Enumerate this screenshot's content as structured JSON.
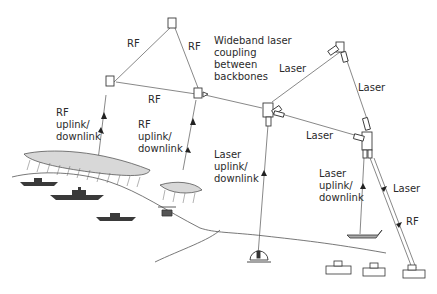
{
  "diagram": {
    "nodes": {
      "rf_top": "RF relay (top)",
      "rf_left": "RF relay (left)",
      "rf_mid": "RF relay (center, backbone coupling)",
      "laser_center": "Laser node (center)",
      "laser_top": "Laser node (top right)",
      "laser_right": "Laser node (right)"
    },
    "labels": {
      "rf_top_left": "RF",
      "rf_top_right": "RF",
      "rf_bottom": "RF",
      "rf_uplink_left": "RF\nuplink/\ndownlink",
      "rf_uplink_mid": "RF\nuplink/\ndownlink",
      "wideband": "Wideband laser\ncoupling\nbetween\nbackbones",
      "laser_top_left": "Laser",
      "laser_top_right": "Laser",
      "laser_bottom": "Laser",
      "laser_uplink_center": "Laser\nuplink/\ndownlink",
      "laser_uplink_right": "Laser\nuplink/\ndownlink",
      "laser_right_side": "Laser",
      "rf_right_side": "RF"
    },
    "ground_assets": [
      "ship",
      "ship",
      "ship",
      "helicopter",
      "ground station dome",
      "aircraft",
      "vehicle",
      "vehicle",
      "vehicle"
    ],
    "weather": [
      "cloud bank (large)",
      "cloud (small)"
    ]
  },
  "colors": {
    "ink": "#3a3a3a",
    "line": "#6a6a6a",
    "text": "#2a2a2a"
  }
}
